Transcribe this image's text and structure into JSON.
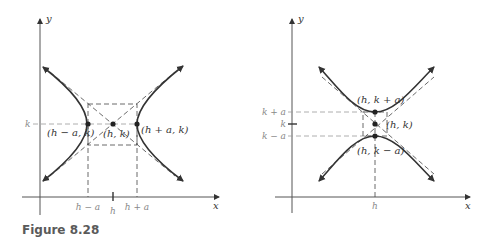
{
  "figure": {
    "caption": "Figure 8.28",
    "caption_color": "#5a5a5a"
  },
  "left_panel": {
    "description": "Horizontal hyperbola (transverse axis parallel to x-axis)",
    "axis_labels": {
      "x": "x",
      "y": "y"
    },
    "y_tick_labels": [
      "k"
    ],
    "x_tick_labels": [
      "h − a",
      "h",
      "h + a"
    ],
    "points": [
      {
        "label": "(h − a, k)",
        "role": "left vertex"
      },
      {
        "label": "(h, k)",
        "role": "center"
      },
      {
        "label": "(h + a, k)",
        "role": "right vertex"
      }
    ]
  },
  "right_panel": {
    "description": "Vertical hyperbola (transverse axis parallel to y-axis)",
    "axis_labels": {
      "x": "x",
      "y": "y"
    },
    "y_tick_labels": [
      "k + a",
      "k",
      "k − a"
    ],
    "x_tick_labels": [
      "h"
    ],
    "points": [
      {
        "label": "(h, k + a)",
        "role": "upper vertex"
      },
      {
        "label": "(h, k)",
        "role": "center"
      },
      {
        "label": "(h, k − a)",
        "role": "lower vertex"
      }
    ]
  }
}
